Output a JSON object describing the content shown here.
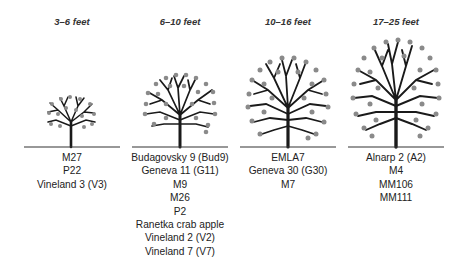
{
  "colors": {
    "branch": "#1a1a1a",
    "fruit": "#8a8a8a",
    "ground": "#333333",
    "background": "#ffffff"
  },
  "columns": [
    {
      "height_range": "3–6 feet",
      "rootstocks": [
        "M27",
        "P22",
        "Vineland 3 (V3)"
      ]
    },
    {
      "height_range": "6–10 feet",
      "rootstocks": [
        "Budagovsky 9 (Bud9)",
        "Geneva 11 (G11)",
        "M9",
        "M26",
        "P2",
        "Ranetka crab apple",
        "Vineland 2 (V2)",
        "Vineland 7 (V7)"
      ]
    },
    {
      "height_range": "10–16 feet",
      "rootstocks": [
        "EMLA7",
        "Geneva 30 (G30)",
        "M7"
      ]
    },
    {
      "height_range": "17–25 feet",
      "rootstocks": [
        "Alnarp 2 (A2)",
        "M4",
        "MM106",
        "MM111"
      ]
    }
  ]
}
